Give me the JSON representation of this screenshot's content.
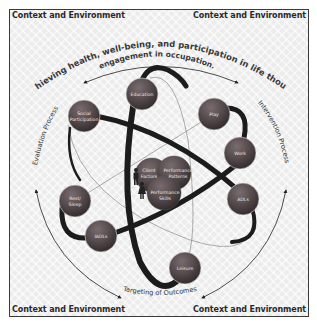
{
  "corners": {
    "top_left": "Context and Environment",
    "top_right": "Context and Environment",
    "bottom_left": "Context and Environment",
    "bottom_right": "Context and Environment"
  },
  "title_arc": {
    "line1": "Achieving health, well-being, and participation in life though",
    "line2": "engagement in occupation."
  },
  "process_labels": {
    "left": "Evaluation Process",
    "right": "Intervention Process",
    "bottom": "Targeting of Outcomes"
  },
  "occupations": [
    {
      "id": "education",
      "label": "Education"
    },
    {
      "id": "social-participation",
      "label_line1": "Social",
      "label_line2": "Participation"
    },
    {
      "id": "play",
      "label": "Play"
    },
    {
      "id": "work",
      "label": "Work"
    },
    {
      "id": "adls",
      "label": "ADLs"
    },
    {
      "id": "rest-sleep",
      "label_line1": "Rest/",
      "label_line2": "Sleep"
    },
    {
      "id": "iadls",
      "label": "IADLs"
    },
    {
      "id": "leisure",
      "label": "Leisure"
    }
  ],
  "core": [
    {
      "id": "client-factors",
      "label_line1": "Client",
      "label_line2": "Factors"
    },
    {
      "id": "performance-patterns",
      "label_line1": "Performance",
      "label_line2": "Patterns"
    },
    {
      "id": "performance-skills",
      "label_line1": "Performance",
      "label_line2": "Skills"
    }
  ],
  "colors": {
    "node_fill": "#4e4446",
    "node_highlight": "#7a6c6e",
    "band": "#1c1c1c",
    "thin_line": "#8a8a8a",
    "background": "#ececec"
  }
}
